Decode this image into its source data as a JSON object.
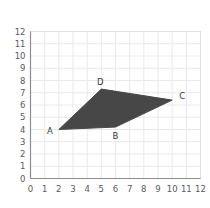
{
  "chart_data": {
    "type": "scatter",
    "title": "",
    "xlabel": "",
    "ylabel": "",
    "xlim": [
      0,
      12
    ],
    "ylim": [
      0,
      12
    ],
    "grid": true,
    "legend": "none",
    "shape": "quadrilateral",
    "fill_color": "#474747",
    "points": [
      {
        "label": "A",
        "x": 2,
        "y": 4.0,
        "label_pos": "left"
      },
      {
        "label": "B",
        "x": 6,
        "y": 4.2,
        "label_pos": "below"
      },
      {
        "label": "C",
        "x": 10,
        "y": 6.4,
        "label_pos": "right"
      },
      {
        "label": "D",
        "x": 5,
        "y": 7.3,
        "label_pos": "above"
      }
    ],
    "polygon_order": [
      "A",
      "B",
      "C",
      "D"
    ],
    "x_ticks": [
      0,
      1,
      2,
      3,
      4,
      5,
      6,
      7,
      8,
      9,
      10,
      11,
      12
    ],
    "y_ticks": [
      0,
      1,
      2,
      3,
      4,
      5,
      6,
      7,
      8,
      9,
      10,
      11,
      12
    ],
    "x_tick_labels": [
      "0",
      "1",
      "2",
      "3",
      "4",
      "5",
      "6",
      "7",
      "8",
      "9",
      "10",
      "11",
      "12"
    ],
    "y_tick_labels": [
      "0",
      "1",
      "2",
      "3",
      "4",
      "5",
      "6",
      "7",
      "8",
      "9",
      "10",
      "11",
      "12"
    ]
  },
  "colors": {
    "grid": "#e9e9ec",
    "axis": "#8e8e92",
    "tick_label": "#59595b",
    "vertex_label": "#3a3a3a",
    "background": "#ffffff"
  }
}
